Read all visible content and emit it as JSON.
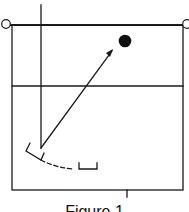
{
  "figure": {
    "caption": "Figure 1",
    "colors": {
      "stroke": "#1a1a1a",
      "background": "#ffffff",
      "ball": "#111111"
    }
  },
  "diagram": {
    "elements": [
      {
        "id": "net-line",
        "type": "line",
        "description": "top boundary line with posts"
      },
      {
        "id": "left-post",
        "type": "circle-outline"
      },
      {
        "id": "right-post",
        "type": "circle-outline"
      },
      {
        "id": "court-boundary",
        "type": "rectangle"
      },
      {
        "id": "attack-line",
        "type": "horizontal-line"
      },
      {
        "id": "player-path-line",
        "type": "vertical-line"
      },
      {
        "id": "ball",
        "type": "filled-circle"
      },
      {
        "id": "pass-arrow",
        "type": "arrow",
        "description": "arrow from player toward ball"
      },
      {
        "id": "player-start-marker",
        "type": "bracket-marker"
      },
      {
        "id": "player-end-marker",
        "type": "bracket-marker"
      },
      {
        "id": "movement-path",
        "type": "dashed-curve"
      },
      {
        "id": "center-tick",
        "type": "tick-mark"
      }
    ]
  }
}
